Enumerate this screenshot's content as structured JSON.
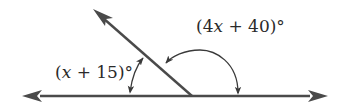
{
  "diagram": {
    "type": "linear-pair-angles",
    "colors": {
      "line": "#4a4a4a",
      "arc": "#3a3a3a",
      "text": "#2a2a2a",
      "background": "#ffffff"
    },
    "lines": {
      "horizontal": {
        "description": "line with arrows at both ends"
      },
      "ray": {
        "description": "ray from vertex on the line toward upper-left"
      }
    },
    "angles": [
      {
        "id": "small",
        "label_open": "(",
        "label_var": "x",
        "label_rest": " + 15)°",
        "full_label": "(x + 15)°"
      },
      {
        "id": "large",
        "label_open": "(4",
        "label_var": "x",
        "label_rest": " + 40)°",
        "full_label": "(4x + 40)°"
      }
    ]
  }
}
